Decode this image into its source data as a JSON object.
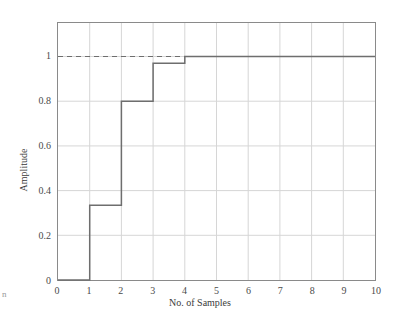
{
  "chart_data": {
    "type": "line",
    "subtype": "step-post",
    "title": "",
    "xlabel": "No. of Samples",
    "ylabel": "Amplitude",
    "xlim": [
      0,
      10
    ],
    "ylim": [
      0,
      1.15
    ],
    "xticks": [
      0,
      1,
      2,
      3,
      4,
      5,
      6,
      7,
      8,
      9,
      10
    ],
    "xtick_labels": [
      "0",
      "1",
      "2",
      "3",
      "4",
      "5",
      "6",
      "7",
      "8",
      "9",
      "10"
    ],
    "yticks": [
      0,
      0.2,
      0.4,
      0.6,
      0.8,
      1
    ],
    "ytick_labels": [
      "0",
      "0.2",
      "0.4",
      "0.6",
      "0.8",
      "1"
    ],
    "grid": true,
    "legend": "none",
    "series": [
      {
        "name": "step-response",
        "style": "solid",
        "color": "#6e6e6e",
        "x": [
          0,
          1,
          1,
          2,
          2,
          3,
          3,
          4,
          4,
          10
        ],
        "y": [
          0,
          0,
          0.335,
          0.335,
          0.8,
          0.8,
          0.97,
          0.97,
          1.0,
          1.0
        ],
        "steps": [
          {
            "from_x": 0,
            "to_x": 1,
            "value": 0
          },
          {
            "from_x": 1,
            "to_x": 2,
            "value": 0.335
          },
          {
            "from_x": 2,
            "to_x": 3,
            "value": 0.8
          },
          {
            "from_x": 3,
            "to_x": 4,
            "value": 0.97
          },
          {
            "from_x": 4,
            "to_x": 10,
            "value": 1.0
          }
        ]
      },
      {
        "name": "reference-line",
        "style": "dashed",
        "color": "#6e6e6e",
        "y_constant": 1.0,
        "x_start": 0,
        "x_end": 6
      }
    ],
    "colors": {
      "grid": "#d6d6d6",
      "frame": "#8a8a8a",
      "data": "#6e6e6e",
      "text": "#3b3b3b",
      "background": "#ffffff"
    }
  },
  "axes": {
    "x_title": "No. of Samples",
    "y_title": "Amplitude"
  },
  "edge": {
    "fragment": "n"
  }
}
